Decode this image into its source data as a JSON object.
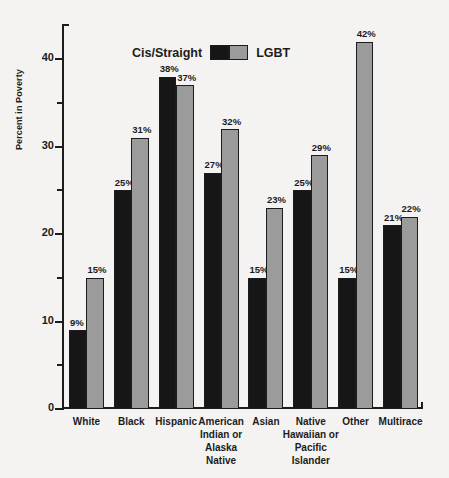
{
  "chart_data": {
    "type": "bar",
    "title": "",
    "xlabel": "",
    "ylabel": "Percent in Poverty",
    "ylim": [
      0,
      44
    ],
    "grid": false,
    "legend_position": "top-center",
    "categories": [
      "White",
      "Black",
      "Hispanic",
      "American Indian or Alaska Native",
      "Asian",
      "Native Hawaiian or Pacific Islander",
      "Other",
      "Multirace"
    ],
    "category_lines": [
      [
        "White"
      ],
      [
        "Black"
      ],
      [
        "Hispanic"
      ],
      [
        "American",
        "Indian or",
        "Alaska Native"
      ],
      [
        "Asian"
      ],
      [
        "Native",
        "Hawaiian or",
        "Pacific Islander"
      ],
      [
        "Other"
      ],
      [
        "Multirace"
      ]
    ],
    "series": [
      {
        "name": "Cis/Straight",
        "color": "#161616",
        "values": [
          9,
          25,
          38,
          27,
          15,
          25,
          15,
          21
        ],
        "labels": [
          "9%",
          "25%",
          "38%",
          "27%",
          "15%",
          "25%",
          "15%",
          "21%"
        ]
      },
      {
        "name": "LGBT",
        "color": "#9b9b9b",
        "values": [
          15,
          31,
          37,
          32,
          23,
          29,
          42,
          22
        ],
        "labels": [
          "15%",
          "31%",
          "37%",
          "32%",
          "23%",
          "29%",
          "42%",
          "22%"
        ]
      }
    ],
    "y_ticks_major": [
      0,
      10,
      20,
      30,
      40
    ],
    "y_tick_labels": [
      "0",
      "10",
      "20",
      "30",
      "40"
    ],
    "y_ticks_minor": [
      5,
      15,
      25,
      35
    ]
  },
  "legend": {
    "left_label": "Cis/Straight",
    "right_label": "LGBT"
  },
  "axes": {
    "y_title": "Percent in Poverty"
  }
}
